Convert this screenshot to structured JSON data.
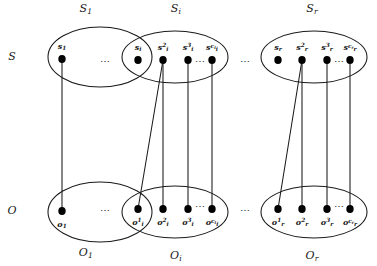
{
  "figure": {
    "ink_color": "#1a1a1a",
    "background_color": "#ffffff",
    "node_fill": "#000000"
  },
  "side_labels": {
    "top_row": "S",
    "bottom_row": "O"
  },
  "ellipsis": {
    "between_groups": "⋯",
    "between_nodes": "⋯"
  },
  "top_groups": [
    {
      "id": "S1",
      "label_main": "S",
      "label_sub": "1",
      "cx": 100,
      "cy": 57,
      "rx": 52,
      "ry": 30,
      "nodes": [
        {
          "id": "s1",
          "base": "s",
          "sub": "1",
          "sup": "",
          "x": 62,
          "y": 59,
          "label_dy": -13
        }
      ],
      "node_ellipsis": null
    },
    {
      "id": "Si",
      "label_main": "S",
      "label_sub": "i",
      "cx": 175,
      "cy": 57,
      "rx": 53,
      "ry": 26,
      "nodes": [
        {
          "id": "si1",
          "base": "s",
          "sub": "i",
          "sup": "",
          "x": 138,
          "y": 60,
          "label_dy": -13
        },
        {
          "id": "si2",
          "base": "s",
          "sub": "i",
          "sup": "2",
          "x": 163,
          "y": 60,
          "label_dy": -13
        },
        {
          "id": "si3",
          "base": "s",
          "sub": "i",
          "sup": "3",
          "x": 188,
          "y": 60,
          "label_dy": -13
        },
        {
          "id": "sici",
          "base": "s",
          "sub": "i",
          "sup": "c",
          "sup_sub": "i",
          "x": 212,
          "y": 60,
          "label_dy": -13
        }
      ],
      "node_ellipsis": {
        "x": 200,
        "y": 61
      }
    },
    {
      "id": "Sr",
      "label_main": "S",
      "label_sub": "r",
      "cx": 314,
      "cy": 57,
      "rx": 53,
      "ry": 26,
      "nodes": [
        {
          "id": "sr1",
          "base": "s",
          "sub": "r",
          "sup": "",
          "x": 278,
          "y": 60,
          "label_dy": -13
        },
        {
          "id": "sr2",
          "base": "s",
          "sub": "r",
          "sup": "2",
          "x": 302,
          "y": 60,
          "label_dy": -13
        },
        {
          "id": "sr3",
          "base": "s",
          "sub": "r",
          "sup": "3",
          "x": 327,
          "y": 60,
          "label_dy": -13
        },
        {
          "id": "srcr",
          "base": "s",
          "sub": "r",
          "sup": "c",
          "sup_sub": "r",
          "x": 350,
          "y": 60,
          "label_dy": -13
        }
      ],
      "node_ellipsis": {
        "x": 339,
        "y": 61
      }
    }
  ],
  "bottom_groups": [
    {
      "id": "O1",
      "label_main": "O",
      "label_sub": "1",
      "cx": 100,
      "cy": 212,
      "rx": 52,
      "ry": 30,
      "nodes": [
        {
          "id": "o1",
          "base": "o",
          "sub": "1",
          "sup": "",
          "x": 62,
          "y": 211,
          "label_dy": 13
        }
      ],
      "node_ellipsis": null
    },
    {
      "id": "Oi",
      "label_main": "O",
      "label_sub": "i",
      "cx": 175,
      "cy": 212,
      "rx": 53,
      "ry": 26,
      "nodes": [
        {
          "id": "oi1",
          "base": "o",
          "sub": "i",
          "sup": "1",
          "x": 138,
          "y": 209,
          "label_dy": 13
        },
        {
          "id": "oi2",
          "base": "o",
          "sub": "i",
          "sup": "2",
          "x": 163,
          "y": 209,
          "label_dy": 13
        },
        {
          "id": "oi3",
          "base": "o",
          "sub": "i",
          "sup": "3",
          "x": 188,
          "y": 209,
          "label_dy": 13
        },
        {
          "id": "oici",
          "base": "o",
          "sub": "i",
          "sup": "c",
          "sup_sub": "i",
          "x": 212,
          "y": 209,
          "label_dy": 13
        }
      ],
      "node_ellipsis": {
        "x": 200,
        "y": 206
      }
    },
    {
      "id": "Or",
      "label_main": "O",
      "label_sub": "r",
      "cx": 314,
      "cy": 212,
      "rx": 53,
      "ry": 26,
      "nodes": [
        {
          "id": "or1",
          "base": "o",
          "sub": "r",
          "sup": "1",
          "x": 278,
          "y": 209,
          "label_dy": 13
        },
        {
          "id": "or2",
          "base": "o",
          "sub": "r",
          "sup": "2",
          "x": 302,
          "y": 209,
          "label_dy": 13
        },
        {
          "id": "or3",
          "base": "o",
          "sub": "r",
          "sup": "3",
          "x": 327,
          "y": 209,
          "label_dy": 13
        },
        {
          "id": "orcr",
          "base": "o",
          "sub": "r",
          "sup": "c",
          "sup_sub": "r",
          "x": 350,
          "y": 209,
          "label_dy": 13
        }
      ],
      "node_ellipsis": {
        "x": 339,
        "y": 206
      }
    }
  ],
  "edges": [
    {
      "from": "s1",
      "to": "o1",
      "x1": 62,
      "y1": 59,
      "x2": 62,
      "y2": 211
    },
    {
      "from": "si2",
      "to": "oi1",
      "x1": 163,
      "y1": 60,
      "x2": 138,
      "y2": 209
    },
    {
      "from": "si2",
      "to": "oi2",
      "x1": 163,
      "y1": 60,
      "x2": 163,
      "y2": 209
    },
    {
      "from": "si3",
      "to": "oi3",
      "x1": 188,
      "y1": 60,
      "x2": 188,
      "y2": 209
    },
    {
      "from": "sici",
      "to": "oici",
      "x1": 212,
      "y1": 60,
      "x2": 212,
      "y2": 209
    },
    {
      "from": "sr2",
      "to": "or1",
      "x1": 302,
      "y1": 60,
      "x2": 278,
      "y2": 209
    },
    {
      "from": "sr2",
      "to": "or2",
      "x1": 302,
      "y1": 60,
      "x2": 302,
      "y2": 209
    },
    {
      "from": "sr3",
      "to": "or3",
      "x1": 327,
      "y1": 60,
      "x2": 327,
      "y2": 209
    },
    {
      "from": "srcr",
      "to": "orcr",
      "x1": 350,
      "y1": 60,
      "x2": 350,
      "y2": 209
    }
  ],
  "group_ellipses_between": [
    {
      "x": 105,
      "y": 61
    },
    {
      "x": 105,
      "y": 210
    },
    {
      "x": 245,
      "y": 61
    },
    {
      "x": 245,
      "y": 210
    }
  ],
  "side_label_positions": {
    "top": {
      "x": 12,
      "y": 56
    },
    "bottom": {
      "x": 12,
      "y": 210
    }
  },
  "group_label_positions": {
    "S1": {
      "x": 86,
      "y": 9
    },
    "Si": {
      "x": 176,
      "y": 9
    },
    "Sr": {
      "x": 312,
      "y": 9
    },
    "O1": {
      "x": 86,
      "y": 253
    },
    "Oi": {
      "x": 176,
      "y": 256
    },
    "Or": {
      "x": 312,
      "y": 256
    }
  }
}
